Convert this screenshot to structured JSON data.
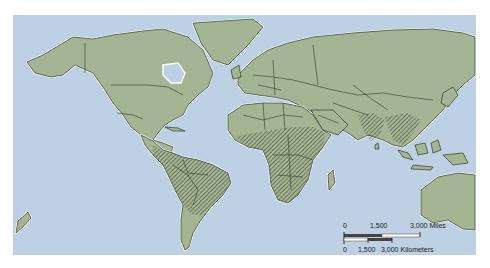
{
  "map": {
    "type": "world-political-outline",
    "projection": "Robinson-like",
    "colors": {
      "ocean": "#bdd0e4",
      "land": "#a4b593",
      "borders": "#2f3a2a",
      "coastline_halo": "#ffffff",
      "hatch": "#2f3a2a"
    },
    "legend": {
      "hatched_regions": [
        "Central America & northern South America",
        "Sub-Saharan Africa",
        "South Asia",
        "Southeast Asia"
      ]
    }
  },
  "scale_bar": {
    "miles": {
      "ticks": [
        "0",
        "1,500",
        "3,000 Miles"
      ]
    },
    "kilometers": {
      "ticks": [
        "0",
        "1,500",
        "3,000 Kilometers"
      ]
    }
  }
}
